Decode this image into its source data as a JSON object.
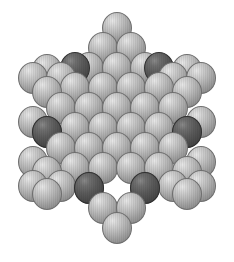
{
  "figure": {
    "canvas": {
      "width": 234,
      "height": 262,
      "background": "#ffffff"
    },
    "sphere_radius_x": 15,
    "sphere_radius_y": 16,
    "colors": {
      "light_fill": "#b8b8b8",
      "light_highlight": "#e8e8e8",
      "light_shadow": "#7d7d7d",
      "light_outline": "#6e6e6e",
      "dark_fill": "#4a4a4a",
      "dark_highlight": "#8a8a8a",
      "dark_shadow": "#3a3a3a",
      "dark_outline": "#2f2f2f"
    },
    "counts": {
      "total_spheres": 61,
      "light_spheres": 55,
      "dark_spheres": 6
    }
  },
  "chart_data": {
    "type": "scatter",
    "xlabel": "",
    "ylabel": "",
    "xlim": [
      0,
      234
    ],
    "ylim": [
      0,
      262
    ],
    "grid": false,
    "legend": null,
    "series": [
      {
        "name": "light-spheres",
        "color": "#b8b8b8",
        "points": [
          [
            117,
            28
          ],
          [
            103,
            48
          ],
          [
            131,
            48
          ],
          [
            89,
            68
          ],
          [
            117,
            68
          ],
          [
            145,
            68
          ],
          [
            33,
            78
          ],
          [
            47,
            70
          ],
          [
            61,
            78
          ],
          [
            173,
            78
          ],
          [
            187,
            70
          ],
          [
            201,
            78
          ],
          [
            47,
            92
          ],
          [
            75,
            88
          ],
          [
            103,
            88
          ],
          [
            131,
            88
          ],
          [
            159,
            88
          ],
          [
            187,
            92
          ],
          [
            61,
            108
          ],
          [
            89,
            108
          ],
          [
            117,
            108
          ],
          [
            145,
            108
          ],
          [
            173,
            108
          ],
          [
            33,
            122
          ],
          [
            201,
            122
          ],
          [
            47,
            132
          ],
          [
            75,
            128
          ],
          [
            103,
            128
          ],
          [
            131,
            128
          ],
          [
            159,
            128
          ],
          [
            187,
            132
          ],
          [
            61,
            148
          ],
          [
            89,
            148
          ],
          [
            117,
            148
          ],
          [
            145,
            148
          ],
          [
            173,
            148
          ],
          [
            33,
            162
          ],
          [
            201,
            162
          ],
          [
            47,
            172
          ],
          [
            75,
            168
          ],
          [
            103,
            168
          ],
          [
            131,
            168
          ],
          [
            159,
            168
          ],
          [
            187,
            172
          ],
          [
            33,
            186
          ],
          [
            47,
            194
          ],
          [
            61,
            186
          ],
          [
            173,
            186
          ],
          [
            187,
            194
          ],
          [
            201,
            186
          ],
          [
            89,
            188
          ],
          [
            145,
            188
          ],
          [
            103,
            208
          ],
          [
            131,
            208
          ],
          [
            117,
            228
          ]
        ]
      },
      {
        "name": "dark-marker-spheres",
        "color": "#4a4a4a",
        "points": [
          [
            75,
            68
          ],
          [
            159,
            68
          ],
          [
            47,
            132
          ],
          [
            187,
            132
          ],
          [
            89,
            188
          ],
          [
            145,
            188
          ]
        ]
      }
    ],
    "annotations": [
      {
        "label": "central-vacancy",
        "x": 117,
        "y": 128,
        "shape": "hexagonal-hole"
      }
    ]
  }
}
